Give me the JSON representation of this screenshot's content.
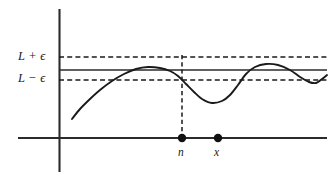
{
  "figure": {
    "title": "",
    "type": "limit-epsilon-band-diagram",
    "background_color": "#ffffff",
    "ink_color": "#1a1a1a"
  },
  "labels": {
    "upper_bound": "L + ϵ",
    "lower_bound": "L − ϵ",
    "point_n": "n",
    "point_x": "x"
  },
  "axes": {
    "x_axis": {
      "y": 138,
      "x_start": 18,
      "x_end": 327
    },
    "y_axis": {
      "x": 59,
      "y_start": 9,
      "y_end": 172
    }
  },
  "chart_data": {
    "type": "line",
    "title": "",
    "xlabel": "",
    "ylabel": "",
    "grid": false,
    "legend": null,
    "annotations": [
      {
        "name": "upper_bound_line",
        "style": "dashed",
        "label": "L + ϵ",
        "y_px": 57
      },
      {
        "name": "limit_line",
        "style": "solid",
        "label": "L",
        "y_px": 70
      },
      {
        "name": "lower_bound_line",
        "style": "dashed",
        "label": "L − ϵ",
        "y_px": 80
      },
      {
        "name": "vertical_drop_at_n",
        "style": "dashed",
        "x_px": 182,
        "y_from_px": 57,
        "y_to_px": 138
      }
    ],
    "markers": [
      {
        "name": "n",
        "label": "n",
        "x_px": 182,
        "y_px": 138
      },
      {
        "name": "x",
        "label": "x",
        "x_px": 218,
        "y_px": 138
      }
    ],
    "curve_points_px": [
      [
        72,
        119
      ],
      [
        80,
        109
      ],
      [
        90,
        99
      ],
      [
        100,
        90
      ],
      [
        112,
        81
      ],
      [
        124,
        74
      ],
      [
        136,
        69
      ],
      [
        148,
        67
      ],
      [
        160,
        68
      ],
      [
        170,
        71
      ],
      [
        178,
        76
      ],
      [
        186,
        84
      ],
      [
        194,
        92
      ],
      [
        202,
        99
      ],
      [
        212,
        103
      ],
      [
        222,
        101
      ],
      [
        230,
        95
      ],
      [
        238,
        85
      ],
      [
        246,
        74
      ],
      [
        255,
        67
      ],
      [
        266,
        64
      ],
      [
        278,
        65
      ],
      [
        290,
        70
      ],
      [
        300,
        77
      ],
      [
        309,
        82
      ],
      [
        316,
        83
      ],
      [
        322,
        79
      ],
      [
        327,
        75
      ]
    ]
  }
}
